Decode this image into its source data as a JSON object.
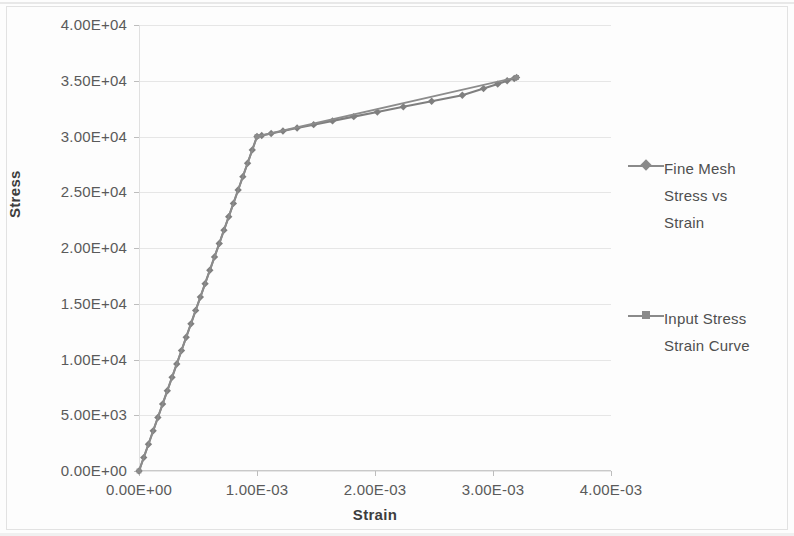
{
  "chart_data": {
    "type": "line",
    "title": "",
    "xlabel": "Strain",
    "ylabel": "Stress",
    "xlim": [
      0,
      0.004
    ],
    "ylim": [
      0,
      40000
    ],
    "grid": true,
    "legend_position": "right",
    "x_tick_labels": [
      "0.00E+00",
      "1.00E-03",
      "2.00E-03",
      "3.00E-03",
      "4.00E-03"
    ],
    "x_tick_values": [
      0,
      0.001,
      0.002,
      0.003,
      0.004
    ],
    "y_tick_labels": [
      "0.00E+00",
      "5.00E+03",
      "1.00E+04",
      "1.50E+04",
      "2.00E+04",
      "2.50E+04",
      "3.00E+04",
      "3.50E+04",
      "4.00E+04"
    ],
    "y_tick_values": [
      0,
      5000,
      10000,
      15000,
      20000,
      25000,
      30000,
      35000,
      40000
    ],
    "series": [
      {
        "name": "Fine Mesh Stress vs Strain",
        "marker": "diamond",
        "color": "#7f7f7f",
        "x": [
          0.0,
          4e-05,
          8e-05,
          0.00012,
          0.00016,
          0.0002,
          0.00024,
          0.00028,
          0.00032,
          0.00036,
          0.0004,
          0.00044,
          0.00048,
          0.00052,
          0.00056,
          0.0006,
          0.00064,
          0.00068,
          0.00072,
          0.00076,
          0.0008,
          0.00084,
          0.00088,
          0.00092,
          0.00096,
          0.001,
          0.00104,
          0.00112,
          0.00122,
          0.00134,
          0.00148,
          0.00164,
          0.00182,
          0.00202,
          0.00224,
          0.00248,
          0.00274,
          0.00292,
          0.00304,
          0.00312,
          0.00318,
          0.0032
        ],
        "y": [
          0,
          1200,
          2400,
          3600,
          4800,
          6000,
          7200,
          8400,
          9600,
          10800,
          12000,
          13200,
          14400,
          15600,
          16800,
          18000,
          19200,
          20400,
          21600,
          22800,
          24000,
          25200,
          26400,
          27600,
          28800,
          30000,
          30090,
          30270,
          30490,
          30760,
          31060,
          31400,
          31780,
          32200,
          32660,
          33160,
          33700,
          34300,
          34700,
          35000,
          35200,
          35300
        ]
      },
      {
        "name": "Input Stress Strain Curve",
        "marker": "square",
        "color": "#8c8c8c",
        "x": [
          0.0,
          0.001,
          0.0032
        ],
        "y": [
          0,
          30000,
          35300
        ]
      }
    ],
    "annotations": {
      "yield_point": {
        "strain": 0.001,
        "stress": 30000
      },
      "end_point": {
        "strain": 0.0032,
        "stress": 35300
      }
    }
  },
  "legend": {
    "entries": [
      {
        "label": "Fine Mesh\nStress vs\nStrain",
        "marker": "diamond"
      },
      {
        "label": "Input Stress\nStrain Curve",
        "marker": "square"
      }
    ]
  }
}
